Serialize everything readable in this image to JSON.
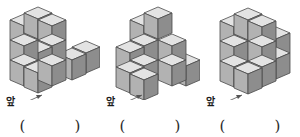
{
  "page": {
    "type": "worksheet-figures",
    "background": "#ffffff",
    "count": 3
  },
  "palette": {
    "cube_top": "#e3e3e3",
    "cube_left": "#b2b2b2",
    "cube_right": "#8d8d8d",
    "cube_edge": "#4a4a4a",
    "label_color": "#1a1a1a",
    "paren_color": "#2b2b2b",
    "arrow_color": "#555555"
  },
  "figures": [
    {
      "id": "figure-1",
      "front_label": "앞",
      "arrow": "arrow-up-right",
      "open_paren": "(",
      "close_paren": ")",
      "cube_count": 9,
      "cubes": [
        {
          "x": 0,
          "y": 0,
          "z": 0
        },
        {
          "x": 0,
          "y": 1,
          "z": 0
        },
        {
          "x": 1,
          "y": 0,
          "z": 0
        },
        {
          "x": 1,
          "y": 1,
          "z": 0
        },
        {
          "x": 0,
          "y": 1,
          "z": 1
        },
        {
          "x": 1,
          "y": 1,
          "z": 1
        },
        {
          "x": 1,
          "y": 1,
          "z": 2
        },
        {
          "x": 2,
          "y": 0,
          "z": 0
        },
        {
          "x": 3,
          "y": 0,
          "z": 0
        }
      ]
    },
    {
      "id": "figure-2",
      "front_label": "앞",
      "arrow": "arrow-up-right",
      "open_paren": "(",
      "close_paren": ")",
      "cube_count": 9,
      "cubes": [
        {
          "x": 0,
          "y": 0,
          "z": 0
        },
        {
          "x": 1,
          "y": 0,
          "z": 0
        },
        {
          "x": 0,
          "y": 1,
          "z": 0
        },
        {
          "x": 1,
          "y": 1,
          "z": 0
        },
        {
          "x": 0,
          "y": 1,
          "z": 1
        },
        {
          "x": 1,
          "y": 1,
          "z": 1
        },
        {
          "x": 1,
          "y": 1,
          "z": 2
        },
        {
          "x": 2,
          "y": 0,
          "z": 0
        },
        {
          "x": 2,
          "y": 1,
          "z": 0
        },
        {
          "x": 2,
          "y": 1,
          "z": 1
        },
        {
          "x": 3,
          "y": 0,
          "z": 0
        }
      ]
    },
    {
      "id": "figure-3",
      "front_label": "앞",
      "arrow": "arrow-up-right",
      "open_paren": "(",
      "close_paren": ")",
      "cube_count": 11,
      "cubes": [
        {
          "x": 0,
          "y": 1,
          "z": 0
        },
        {
          "x": 0,
          "y": 1,
          "z": 1
        },
        {
          "x": 0,
          "y": 1,
          "z": 2
        },
        {
          "x": 1,
          "y": 1,
          "z": 0
        },
        {
          "x": 1,
          "y": 1,
          "z": 1
        },
        {
          "x": 1,
          "y": 1,
          "z": 2
        },
        {
          "x": 1,
          "y": 0,
          "z": 0
        },
        {
          "x": 2,
          "y": 1,
          "z": 0
        },
        {
          "x": 2,
          "y": 1,
          "z": 1
        },
        {
          "x": 0,
          "y": 1,
          "z": 0
        }
      ]
    }
  ]
}
